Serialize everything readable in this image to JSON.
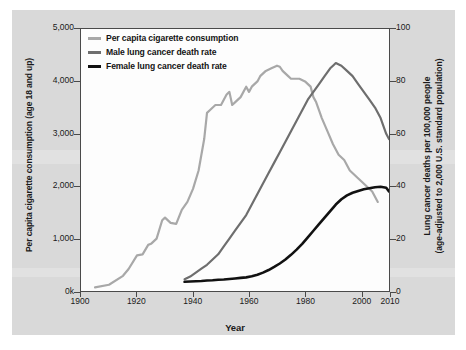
{
  "figure": {
    "background_color": "#d9d9d9",
    "plot_background_color": "#fdfdfd",
    "border_color": "#4a4a4a"
  },
  "legend": {
    "position": "top-left-inside",
    "items": [
      {
        "label": "Per capita cigarette consumption",
        "color": "#a8a8a8",
        "icon": "line-swatch-icon"
      },
      {
        "label": "Male lung cancer death rate",
        "color": "#6e6e6e",
        "icon": "line-swatch-icon"
      },
      {
        "label": "Female lung cancer death rate",
        "color": "#111111",
        "icon": "line-swatch-icon"
      }
    ]
  },
  "axes": {
    "x": {
      "label": "Year",
      "ticks": [
        "1900",
        "1920",
        "1940",
        "1960",
        "1980",
        "2000",
        "2010"
      ],
      "tick_values": [
        1900,
        1920,
        1940,
        1960,
        1980,
        2000,
        2010
      ],
      "range": [
        1900,
        2010
      ]
    },
    "y_left": {
      "label": "Per capita cigarette consumption (age 18 and up)",
      "ticks": [
        "0k",
        "1,000",
        "2,000",
        "3,000",
        "4,000",
        "5,000"
      ],
      "tick_values": [
        0,
        1000,
        2000,
        3000,
        4000,
        5000
      ],
      "range": [
        0,
        5000
      ]
    },
    "y_right": {
      "label_line1": "Lung cancer deaths per 100,000 people",
      "label_line2": "(age-adjusted to 2,000 U.S. standard population)",
      "ticks": [
        "0",
        "20",
        "40",
        "60",
        "80",
        "100"
      ],
      "tick_values": [
        0,
        20,
        40,
        60,
        80,
        100
      ],
      "range": [
        0,
        100
      ]
    }
  },
  "chart_data": {
    "type": "line",
    "title": "",
    "xlabel": "Year",
    "ylabel": "Per capita cigarette consumption (age 18 and up)",
    "ylabel_secondary": "Lung cancer deaths per 100,000 people (age-adjusted to 2,000 U.S. standard population)",
    "xlim": [
      1900,
      2010
    ],
    "ylim": [
      0,
      5000
    ],
    "ylim_secondary": [
      0,
      100
    ],
    "grid": false,
    "legend_position": "upper left",
    "series": [
      {
        "name": "Per capita cigarette consumption",
        "axis": "left",
        "color": "#a8a8a8",
        "units": "cigarettes per capita (age 18 and up)",
        "x": [
          1905,
          1910,
          1915,
          1917,
          1920,
          1922,
          1924,
          1925,
          1927,
          1929,
          1930,
          1932,
          1934,
          1936,
          1938,
          1940,
          1942,
          1944,
          1945,
          1946,
          1948,
          1950,
          1952,
          1953,
          1954,
          1955,
          1957,
          1959,
          1960,
          1961,
          1963,
          1964,
          1966,
          1968,
          1970,
          1971,
          1972,
          1974,
          1975,
          1976,
          1978,
          1980,
          1982,
          1983,
          1984,
          1986,
          1988,
          1990,
          1992,
          1994,
          1996,
          1998,
          2000,
          2002,
          2004,
          2006
        ],
        "y": [
          70,
          120,
          290,
          420,
          680,
          700,
          880,
          900,
          1000,
          1350,
          1400,
          1300,
          1280,
          1550,
          1700,
          1950,
          2300,
          2900,
          3400,
          3450,
          3550,
          3550,
          3750,
          3800,
          3550,
          3600,
          3700,
          3900,
          3800,
          3900,
          4000,
          4100,
          4200,
          4250,
          4300,
          4280,
          4200,
          4100,
          4050,
          4050,
          4050,
          4000,
          3900,
          3700,
          3600,
          3300,
          3050,
          2800,
          2600,
          2500,
          2300,
          2200,
          2100,
          2000,
          1900,
          1700
        ]
      },
      {
        "name": "Male lung cancer death rate",
        "axis": "right",
        "color": "#6e6e6e",
        "units": "deaths per 100,000",
        "x": [
          1937,
          1939,
          1941,
          1943,
          1945,
          1947,
          1949,
          1951,
          1953,
          1955,
          1957,
          1959,
          1961,
          1963,
          1965,
          1967,
          1969,
          1971,
          1973,
          1975,
          1977,
          1979,
          1981,
          1983,
          1985,
          1987,
          1989,
          1990,
          1991,
          1993,
          1995,
          1997,
          1999,
          2001,
          2003,
          2005,
          2007,
          2009,
          2010
        ],
        "y": [
          4.5,
          5.5,
          7,
          8.5,
          10,
          12,
          14,
          17,
          20,
          23,
          26,
          29,
          33,
          37,
          41,
          45,
          49,
          53,
          57,
          61,
          65,
          69,
          73,
          76,
          79,
          82,
          85,
          86,
          87,
          86,
          84,
          82,
          79,
          76,
          73,
          70,
          66,
          60,
          58
        ]
      },
      {
        "name": "Female lung cancer death rate",
        "axis": "right",
        "color": "#111111",
        "units": "deaths per 100,000",
        "x": [
          1937,
          1939,
          1941,
          1943,
          1945,
          1947,
          1949,
          1951,
          1953,
          1955,
          1957,
          1959,
          1961,
          1963,
          1965,
          1967,
          1969,
          1971,
          1973,
          1975,
          1977,
          1979,
          1981,
          1983,
          1985,
          1987,
          1989,
          1991,
          1993,
          1995,
          1997,
          1999,
          2001,
          2003,
          2005,
          2007,
          2009,
          2010
        ],
        "y": [
          3.5,
          3.6,
          3.7,
          3.8,
          4.0,
          4.1,
          4.3,
          4.4,
          4.6,
          4.8,
          5.0,
          5.2,
          5.6,
          6.2,
          7.0,
          8.0,
          9.2,
          10.5,
          12.0,
          13.8,
          15.8,
          18.0,
          20.5,
          23.0,
          25.5,
          28.0,
          30.5,
          33.0,
          35.0,
          36.5,
          37.5,
          38.2,
          38.8,
          39.2,
          39.6,
          39.8,
          39.4,
          38.0
        ]
      }
    ]
  }
}
